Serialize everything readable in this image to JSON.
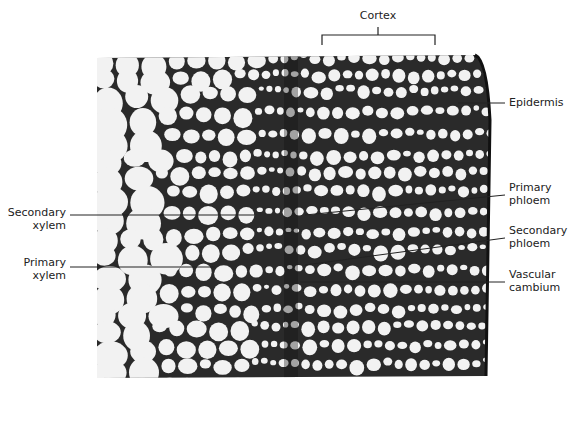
{
  "figure": {
    "type": "micrograph",
    "labels": {
      "cortex": "Cortex",
      "epidermis": "Epidermis",
      "primary_phloem": [
        "Primary",
        "phloem"
      ],
      "secondary_phloem": [
        "Secondary",
        "phloem"
      ],
      "vascular_cambium": [
        "Vascular",
        "cambium"
      ],
      "secondary_xylem": [
        "Secondary",
        "xylem"
      ],
      "primary_xylem": [
        "Primary",
        "xylem"
      ]
    },
    "colors": {
      "cell_wall": "#1e1e1e",
      "cell_lumen": "#f2f2f2",
      "label_text": "#222222",
      "leader_line": "#222222"
    }
  }
}
